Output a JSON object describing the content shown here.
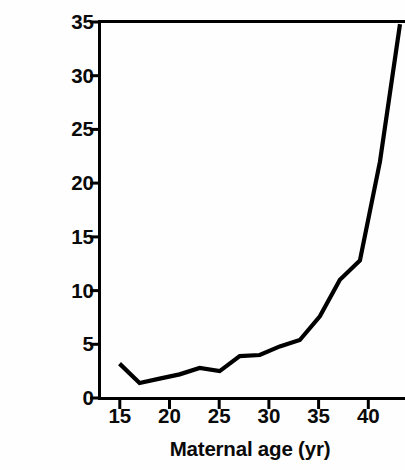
{
  "chart_data": {
    "type": "line",
    "title": "",
    "xlabel": "Maternal age (yr)",
    "ylabel_line1": "Incidence of trisomy",
    "ylabel_line2": "(% of clinically recognized pregnancies)",
    "xlim": [
      13,
      43.5
    ],
    "ylim": [
      0,
      35
    ],
    "xticks": [
      15,
      20,
      25,
      30,
      35,
      40
    ],
    "xtick_labels": [
      "15",
      "20",
      "25",
      "30",
      "35",
      "40"
    ],
    "yticks": [
      0,
      5,
      10,
      15,
      20,
      25,
      30,
      35
    ],
    "ytick_labels": [
      "0",
      "5",
      "10",
      "15",
      "20",
      "25",
      "30",
      "35"
    ],
    "grid": false,
    "legend": null,
    "series": [
      {
        "name": "Incidence of trisomy",
        "color": "#000000",
        "x": [
          15,
          17,
          19,
          21,
          23,
          25,
          27,
          29,
          31,
          33,
          35,
          37,
          39,
          41,
          43
        ],
        "values": [
          3.2,
          1.4,
          1.8,
          2.2,
          2.8,
          2.5,
          3.9,
          4.0,
          4.8,
          5.4,
          7.6,
          11.0,
          12.8,
          22.0,
          34.8
        ]
      }
    ]
  },
  "axis": {
    "line_color": "#000000",
    "line_width": 3
  }
}
